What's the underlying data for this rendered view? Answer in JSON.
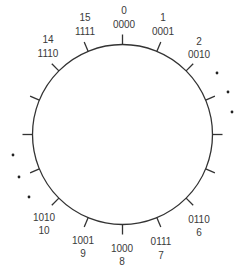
{
  "diagram": {
    "ring": {
      "positions": 16,
      "labeled_nodes": [
        {
          "index": 0,
          "decimal": "0",
          "binary": "0000"
        },
        {
          "index": 1,
          "decimal": "1",
          "binary": "0001"
        },
        {
          "index": 2,
          "decimal": "2",
          "binary": "0010"
        },
        {
          "index": 6,
          "decimal": "6",
          "binary": "0110"
        },
        {
          "index": 7,
          "decimal": "7",
          "binary": "0111"
        },
        {
          "index": 8,
          "decimal": "8",
          "binary": "1000"
        },
        {
          "index": 9,
          "decimal": "9",
          "binary": "1001"
        },
        {
          "index": 10,
          "decimal": "10",
          "binary": "1010"
        },
        {
          "index": 14,
          "decimal": "14",
          "binary": "1110"
        },
        {
          "index": 15,
          "decimal": "15",
          "binary": "1111"
        }
      ],
      "unlabeled_positions": [
        3,
        4,
        5,
        11,
        12,
        13
      ],
      "ellipsis": {
        "right": "vertical ellipsis (3 dots) between 2 and 6",
        "left": "vertical ellipsis (3 dots) between 10 and 14"
      }
    },
    "colors": {
      "line": "#333333",
      "text": "#3a3a3a",
      "background": "#ffffff"
    }
  }
}
